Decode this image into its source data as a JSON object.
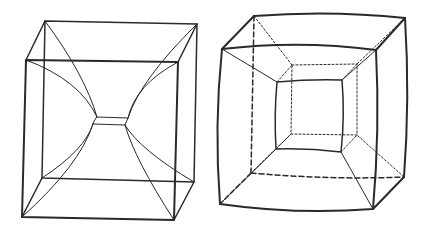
{
  "figure": {
    "panels": [
      {
        "id": "left",
        "description": "Wireframe cube with curved edges converging to a small central square (hypercube-like projection)"
      },
      {
        "id": "right",
        "description": "Wireframe cube with bulging outer edges, inner square and dashed hidden edges (tesseract projection)"
      }
    ],
    "colors": {
      "ink": "#2a2a2a",
      "background": "#ffffff"
    }
  }
}
